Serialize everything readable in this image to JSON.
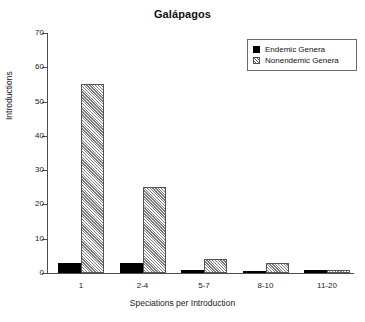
{
  "chart_data": {
    "type": "bar",
    "title": "Galápagos",
    "xlabel": "Speciations per Introduction",
    "ylabel": "Introductions",
    "categories": [
      "1",
      "2-4",
      "5-7",
      "8-10",
      "11-20"
    ],
    "series": [
      {
        "name": "Endemic Genera",
        "values": [
          3,
          3,
          1,
          0,
          1
        ],
        "color": "#000000",
        "fill": "solid"
      },
      {
        "name": "Nonendemic Genera",
        "values": [
          55,
          25,
          4,
          3,
          1
        ],
        "color": "#cfcfcf",
        "fill": "hatched"
      }
    ],
    "ylim": [
      0,
      70
    ],
    "yticks": [
      0,
      10,
      20,
      30,
      40,
      50,
      60,
      70
    ],
    "grid": false,
    "legend_position": "top-right"
  },
  "legend": {
    "entries": [
      {
        "label": "Endemic Genera"
      },
      {
        "label": "Nonendemic Genera"
      }
    ]
  }
}
